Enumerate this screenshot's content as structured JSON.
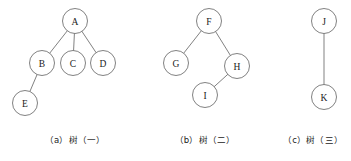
{
  "figure": {
    "type": "tree-diagram-set",
    "background_color": "#ffffff",
    "stroke_color": "#6a6a6a",
    "text_color": "#1a1a1a",
    "node_radius": 12.5
  },
  "trees": [
    {
      "id": "tree-a",
      "caption": "（a）树（一）",
      "caption_x": 75,
      "caption_y": 133,
      "nodes": [
        {
          "id": "A",
          "label": "A",
          "cx": 75,
          "cy": 21,
          "r": 12.5
        },
        {
          "id": "B",
          "label": "B",
          "cx": 42,
          "cy": 63,
          "r": 12.5
        },
        {
          "id": "C",
          "label": "C",
          "cx": 73,
          "cy": 63,
          "r": 12.5
        },
        {
          "id": "D",
          "label": "D",
          "cx": 103,
          "cy": 63,
          "r": 12.5
        },
        {
          "id": "E",
          "label": "E",
          "cx": 25,
          "cy": 103,
          "r": 12.5
        }
      ],
      "edges": [
        {
          "from": "A",
          "to": "B"
        },
        {
          "from": "A",
          "to": "C"
        },
        {
          "from": "A",
          "to": "D"
        },
        {
          "from": "B",
          "to": "E"
        }
      ]
    },
    {
      "id": "tree-b",
      "caption": "（b）树（二）",
      "caption_x": 205,
      "caption_y": 133,
      "nodes": [
        {
          "id": "F",
          "label": "F",
          "cx": 209,
          "cy": 21,
          "r": 12.5
        },
        {
          "id": "G",
          "label": "G",
          "cx": 176,
          "cy": 63,
          "r": 12.5
        },
        {
          "id": "H",
          "label": "H",
          "cx": 237,
          "cy": 66,
          "r": 12.5
        },
        {
          "id": "I",
          "label": "I",
          "cx": 205,
          "cy": 95,
          "r": 12.5
        }
      ],
      "edges": [
        {
          "from": "F",
          "to": "G"
        },
        {
          "from": "F",
          "to": "H"
        },
        {
          "from": "H",
          "to": "I"
        }
      ]
    },
    {
      "id": "tree-c",
      "caption": "（c）树（三）",
      "caption_x": 313,
      "caption_y": 133,
      "nodes": [
        {
          "id": "J",
          "label": "J",
          "cx": 324,
          "cy": 21,
          "r": 12.5
        },
        {
          "id": "K",
          "label": "K",
          "cx": 324,
          "cy": 97,
          "r": 12.5
        }
      ],
      "edges": [
        {
          "from": "J",
          "to": "K"
        }
      ]
    }
  ]
}
